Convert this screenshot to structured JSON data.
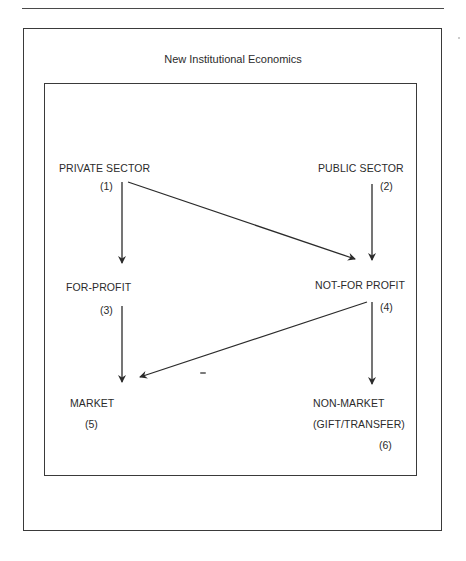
{
  "diagram": {
    "title": "New Institutional Economics",
    "nodes": [
      {
        "id": 1,
        "label": "PRIVATE SECTOR",
        "number": "(1)"
      },
      {
        "id": 2,
        "label": "PUBLIC SECTOR",
        "number": "(2)"
      },
      {
        "id": 3,
        "label": "FOR-PROFIT",
        "number": "(3)"
      },
      {
        "id": 4,
        "label": "NOT-FOR PROFIT",
        "number": "(4)"
      },
      {
        "id": 5,
        "label": "MARKET",
        "number": "(5)"
      },
      {
        "id": 6,
        "label": "NON-MARKET",
        "sublabel": "(GIFT/TRANSFER)",
        "number": "(6)"
      }
    ],
    "edges": [
      {
        "from": 1,
        "to": 3
      },
      {
        "from": 1,
        "to": 4
      },
      {
        "from": 2,
        "to": 4
      },
      {
        "from": 3,
        "to": 5
      },
      {
        "from": 4,
        "to": 5
      },
      {
        "from": 4,
        "to": 6
      }
    ],
    "colors": {
      "line": "#2b2b2b",
      "text": "#2b2b2b",
      "background": "#ffffff"
    }
  }
}
